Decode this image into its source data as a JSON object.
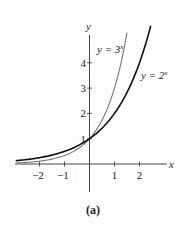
{
  "chart_data": {
    "type": "line",
    "title": "",
    "caption": "(a)",
    "xlabel": "x",
    "ylabel": "y",
    "xlim": [
      -3,
      3
    ],
    "ylim": [
      -1.1,
      5.1
    ],
    "x_ticks": [
      -2,
      -1,
      1,
      2
    ],
    "x_tick_labels": [
      "−2",
      "−1",
      "1",
      "2"
    ],
    "y_ticks": [
      1,
      2,
      3,
      4
    ],
    "y_tick_labels": [
      "1",
      "2",
      "3",
      "4"
    ],
    "grid": false,
    "series": [
      {
        "name": "y = 3^x",
        "label_base": "y = 3",
        "label_exp": "x",
        "color": "#777777",
        "function": "3^x",
        "x_range": [
          -2.95,
          1.5
        ]
      },
      {
        "name": "y = 2^x",
        "label_base": "y = 2",
        "label_exp": "x",
        "color": "#111111",
        "function": "2^x",
        "x_range": [
          -2.95,
          2.45
        ]
      }
    ]
  }
}
